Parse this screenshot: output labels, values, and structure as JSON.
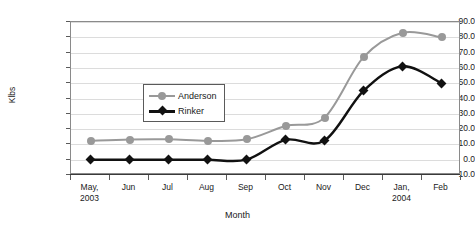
{
  "chart_data": {
    "type": "line",
    "title": "",
    "xlabel": "Month",
    "ylabel": "Klbs",
    "categories": [
      "May, 2003",
      "Jun",
      "Jul",
      "Aug",
      "Sep",
      "Oct",
      "Nov",
      "Dec",
      "Jan, 2004",
      "Feb"
    ],
    "category_lines": [
      [
        "May,",
        "2003"
      ],
      [
        "Jun",
        ""
      ],
      [
        "Jul",
        ""
      ],
      [
        "Aug",
        ""
      ],
      [
        "Sep",
        ""
      ],
      [
        "Oct",
        ""
      ],
      [
        "Nov",
        ""
      ],
      [
        "Dec",
        ""
      ],
      [
        "Jan,",
        "2004"
      ],
      [
        "Feb",
        ""
      ]
    ],
    "ylim": [
      -10.0,
      90.0
    ],
    "ytick_labels": [
      "90.0",
      "80.0",
      "70.0",
      "60.0",
      "50.0",
      "40.0",
      "30.0",
      "20.0",
      "10.0",
      "0.0",
      "-10.0"
    ],
    "ytick_values": [
      90,
      80,
      70,
      60,
      50,
      40,
      30,
      20,
      10,
      0,
      -10
    ],
    "grid": true,
    "legend_position": "inside-upper-left",
    "series": [
      {
        "name": "Anderson",
        "color": "#999999",
        "marker": "circle",
        "values": [
          12.3,
          13.2,
          13.3,
          12.3,
          13.3,
          22.0,
          27.5,
          67.0,
          83.0,
          80.0
        ]
      },
      {
        "name": "Rinker",
        "color": "#111111",
        "marker": "diamond",
        "values": [
          0.0,
          0.0,
          0.0,
          0.0,
          0.0,
          13.0,
          12.5,
          45.0,
          61.0,
          50.0
        ]
      }
    ]
  }
}
